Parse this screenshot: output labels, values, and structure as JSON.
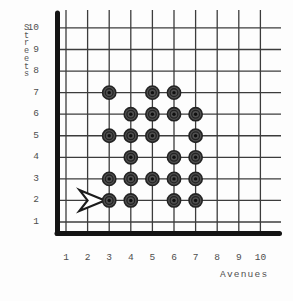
{
  "axis_labels": {
    "y": "Streets",
    "x": "Avenues"
  },
  "chart_data": {
    "type": "scatter",
    "title": "",
    "xlabel": "Avenues",
    "ylabel": "Streets",
    "x_ticks": [
      1,
      2,
      3,
      4,
      5,
      6,
      7,
      8,
      9,
      10
    ],
    "y_ticks": [
      1,
      2,
      3,
      4,
      5,
      6,
      7,
      8,
      9,
      10
    ],
    "xlim": [
      0,
      10.5
    ],
    "ylim": [
      0,
      10.5
    ],
    "grid": true,
    "point_style": "bullseye",
    "points": [
      [
        3,
        2
      ],
      [
        4,
        2
      ],
      [
        6,
        2
      ],
      [
        7,
        2
      ],
      [
        3,
        3
      ],
      [
        4,
        3
      ],
      [
        5,
        3
      ],
      [
        6,
        3
      ],
      [
        7,
        3
      ],
      [
        4,
        4
      ],
      [
        6,
        4
      ],
      [
        7,
        4
      ],
      [
        3,
        5
      ],
      [
        4,
        5
      ],
      [
        5,
        5
      ],
      [
        7,
        5
      ],
      [
        4,
        6
      ],
      [
        5,
        6
      ],
      [
        6,
        6
      ],
      [
        7,
        6
      ],
      [
        3,
        7
      ],
      [
        5,
        7
      ],
      [
        6,
        7
      ]
    ],
    "annotations": [
      {
        "type": "arrow",
        "direction": "right",
        "street": 2,
        "tip_avenue": 2.8,
        "tail_avenue": 1.62
      }
    ]
  },
  "colors": {
    "background": "#fdfdfd",
    "grid_line": "#3c3c3c",
    "axis": "#141414",
    "dot_outer": "#505050",
    "dot_ring": "#232323",
    "dot_center": "#0f0f0f",
    "text": "#4e4e4e",
    "arrow_fill": "#ffffff",
    "arrow_stroke": "#1c1c1c"
  }
}
